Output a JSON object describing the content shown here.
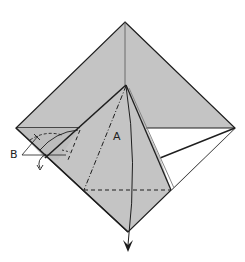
{
  "diagram": {
    "type": "origami-fold-diagram",
    "labels": {
      "a": "A",
      "b": "B"
    },
    "colors": {
      "paper_gray": "#c4c4c4",
      "paper_white": "#ffffff",
      "line": "#1e1e1e"
    },
    "shapes": {
      "outer_square": "diamond",
      "flap": "kite flap with dash-dot valley fold line A",
      "arrows": [
        "down arrow at bottom",
        "small curled arrow at left B"
      ]
    }
  }
}
